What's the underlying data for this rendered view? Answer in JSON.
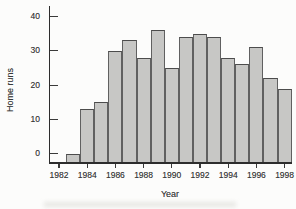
{
  "figure": {
    "background": "#fcfcfb",
    "bar_fill": "#c7c7c5",
    "bar_border": "#606060",
    "axis_color": "#2d2d2d",
    "text_color": "#3a3a3a"
  },
  "chart_data": {
    "type": "bar",
    "title": "",
    "xlabel": "Year",
    "ylabel": "Home runs",
    "x": [
      1983,
      1984,
      1985,
      1986,
      1987,
      1988,
      1989,
      1990,
      1991,
      1992,
      1993,
      1994,
      1995,
      1996,
      1997,
      1998
    ],
    "values": [
      0,
      13,
      15,
      30,
      33,
      28,
      36,
      25,
      34,
      35,
      34,
      28,
      26,
      31,
      22,
      19
    ],
    "x_tick_labels": [
      "1982",
      "1984",
      "1986",
      "1988",
      "1990",
      "1992",
      "1994",
      "1996",
      "1998"
    ],
    "y_ticks": [
      0,
      10,
      20,
      30,
      40
    ],
    "xlim": [
      1982,
      1998
    ],
    "ylim": [
      0,
      40
    ],
    "grid": false,
    "legend": null
  }
}
